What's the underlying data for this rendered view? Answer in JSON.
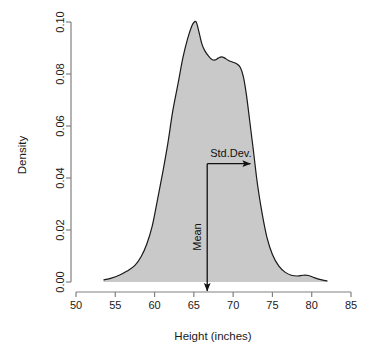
{
  "chart_data": {
    "type": "area",
    "title": "",
    "xlabel": "Height (inches)",
    "ylabel": "Density",
    "xlim": [
      50,
      85
    ],
    "ylim": [
      0.0,
      0.1
    ],
    "grid": false,
    "legend": "none",
    "xticks": [
      "50",
      "55",
      "60",
      "65",
      "70",
      "75",
      "80",
      "85"
    ],
    "xtick_values": [
      50,
      55,
      60,
      65,
      70,
      75,
      80,
      85
    ],
    "yticks": [
      "0.00",
      "0.02",
      "0.04",
      "0.06",
      "0.08",
      "0.10"
    ],
    "ytick_values": [
      0.0,
      0.02,
      0.04,
      0.06,
      0.08,
      0.1
    ],
    "fill_color": "#c9c9c9",
    "line_color": "#1a1a1a",
    "axis_color": "#808080",
    "series": [
      {
        "name": "Height density",
        "x": [
          53.5,
          54.5,
          55.5,
          56.5,
          57.5,
          58.3,
          59.0,
          59.7,
          60.3,
          61.0,
          61.7,
          62.3,
          63.0,
          63.6,
          64.2,
          64.7,
          65.0,
          65.3,
          65.6,
          66.0,
          66.4,
          66.9,
          67.3,
          67.7,
          68.1,
          68.5,
          68.9,
          69.4,
          69.9,
          70.4,
          70.9,
          71.3,
          71.7,
          72.1,
          72.6,
          73.1,
          73.7,
          74.3,
          75.0,
          75.8,
          76.6,
          77.4,
          78.2,
          78.9,
          79.6,
          80.4,
          81.3,
          82.0
        ],
        "y": [
          0.0008,
          0.0015,
          0.0026,
          0.0042,
          0.0064,
          0.0098,
          0.0145,
          0.0215,
          0.0305,
          0.0415,
          0.0535,
          0.0655,
          0.0765,
          0.0862,
          0.0935,
          0.0982,
          0.0998,
          0.1,
          0.0968,
          0.0918,
          0.0889,
          0.0868,
          0.0856,
          0.0854,
          0.0861,
          0.0866,
          0.0862,
          0.0852,
          0.0846,
          0.084,
          0.0826,
          0.079,
          0.0718,
          0.0622,
          0.05,
          0.0375,
          0.0262,
          0.0172,
          0.0106,
          0.0062,
          0.0038,
          0.0026,
          0.0023,
          0.0026,
          0.0025,
          0.0016,
          0.0008,
          0.0004
        ]
      }
    ],
    "annotations": [
      {
        "name": "mean",
        "label": "Mean",
        "orientation": "vertical",
        "x": 66.7,
        "y_from": 0.0455,
        "y_to": 0.0,
        "arrow": "down"
      },
      {
        "name": "std-dev",
        "label": "Std.Dev.",
        "orientation": "horizontal",
        "y": 0.0455,
        "x_from": 66.7,
        "x_to": 72.2,
        "arrow": "right"
      }
    ]
  },
  "axes": {
    "x_label": "Height (inches)",
    "y_label": "Density"
  },
  "annotations": {
    "mean_label": "Mean",
    "stddev_label": "Std.Dev."
  }
}
